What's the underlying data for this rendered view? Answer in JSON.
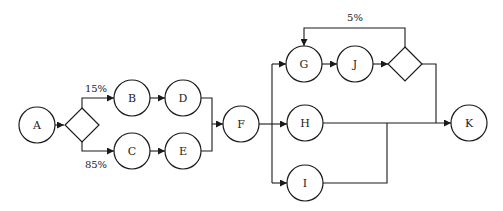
{
  "diagram": {
    "type": "process-flow",
    "nodes": [
      {
        "id": "A",
        "label": "A",
        "shape": "circle"
      },
      {
        "id": "D1",
        "label": "",
        "shape": "decision"
      },
      {
        "id": "B",
        "label": "B",
        "shape": "circle"
      },
      {
        "id": "C",
        "label": "C",
        "shape": "circle"
      },
      {
        "id": "D",
        "label": "D",
        "shape": "circle"
      },
      {
        "id": "E",
        "label": "E",
        "shape": "circle"
      },
      {
        "id": "F",
        "label": "F",
        "shape": "circle"
      },
      {
        "id": "G",
        "label": "G",
        "shape": "circle"
      },
      {
        "id": "H",
        "label": "H",
        "shape": "circle"
      },
      {
        "id": "I",
        "label": "I",
        "shape": "circle"
      },
      {
        "id": "J",
        "label": "J",
        "shape": "circle"
      },
      {
        "id": "D2",
        "label": "",
        "shape": "decision"
      },
      {
        "id": "K",
        "label": "K",
        "shape": "circle"
      }
    ],
    "edges": [
      {
        "from": "A",
        "to": "D1",
        "label": ""
      },
      {
        "from": "D1",
        "to": "B",
        "label": "15%"
      },
      {
        "from": "D1",
        "to": "C",
        "label": "85%"
      },
      {
        "from": "B",
        "to": "D",
        "label": ""
      },
      {
        "from": "C",
        "to": "E",
        "label": ""
      },
      {
        "from": "D",
        "to": "F",
        "label": ""
      },
      {
        "from": "E",
        "to": "F",
        "label": ""
      },
      {
        "from": "F",
        "to": "G",
        "label": ""
      },
      {
        "from": "F",
        "to": "H",
        "label": ""
      },
      {
        "from": "F",
        "to": "I",
        "label": ""
      },
      {
        "from": "G",
        "to": "J",
        "label": ""
      },
      {
        "from": "J",
        "to": "D2",
        "label": ""
      },
      {
        "from": "D2",
        "to": "G",
        "label": "5%"
      },
      {
        "from": "D2",
        "to": "K",
        "label": ""
      },
      {
        "from": "H",
        "to": "K",
        "label": ""
      },
      {
        "from": "I",
        "to": "K",
        "label": ""
      }
    ],
    "labels": {
      "split_top": "15%",
      "split_bottom": "85%",
      "loop_back": "5%"
    }
  }
}
